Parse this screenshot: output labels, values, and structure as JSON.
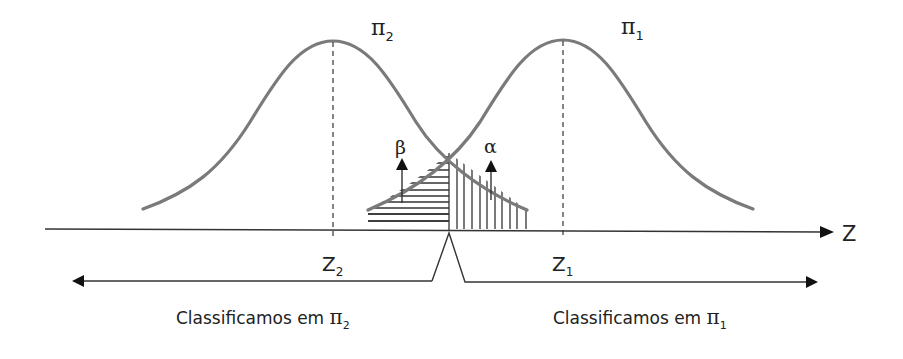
{
  "figure": {
    "populations": [
      {
        "id": "pi2",
        "symbol": "π",
        "subscript": "2",
        "mean_label": "Z",
        "mean_subscript": "2",
        "peak_x": 333
      },
      {
        "id": "pi1",
        "symbol": "π",
        "subscript": "1",
        "mean_label": "Z",
        "mean_subscript": "1",
        "peak_x": 563
      }
    ],
    "axis": {
      "label": "Z"
    },
    "errors": {
      "beta": {
        "symbol": "β",
        "hatch": "horizontal"
      },
      "alpha": {
        "symbol": "α",
        "hatch": "vertical"
      }
    },
    "regions": {
      "left": {
        "text": "Classificamos em ",
        "symbol": "π",
        "subscript": "2"
      },
      "right": {
        "text": "Classificamos em ",
        "symbol": "π",
        "subscript": "1"
      }
    },
    "colors": {
      "curve": "#7a7a7a",
      "lines": "#333333",
      "text": "#222222"
    }
  }
}
